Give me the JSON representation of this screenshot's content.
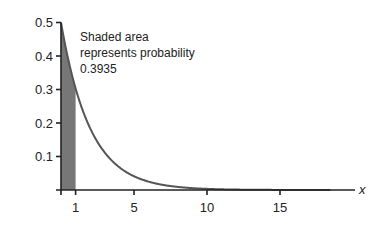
{
  "chart_data": {
    "type": "area",
    "title": "",
    "xlabel": "x",
    "ylabel": "",
    "function": "0.5 * exp(-0.5 * x)",
    "x": [
      0,
      1,
      2,
      3,
      4,
      5,
      6,
      8,
      10,
      12,
      15,
      18.5
    ],
    "values": [
      0.5,
      0.3033,
      0.1839,
      0.1116,
      0.0677,
      0.041,
      0.0249,
      0.0092,
      0.0034,
      0.0012,
      0.0003,
      0.0
    ],
    "shaded_region": {
      "from": 0,
      "to": 1,
      "probability": 0.3935
    },
    "xticks": [
      "1",
      "5",
      "10",
      "15"
    ],
    "yticks": [
      "0.1",
      "0.2",
      "0.3",
      "0.4",
      "0.5"
    ],
    "ylim": [
      0,
      0.5
    ],
    "xlim": [
      0,
      18.5
    ],
    "grid": false,
    "legend": null,
    "annotation": [
      "Shaded area",
      "represents probability",
      "0.3935"
    ],
    "colors": {
      "curve": "#555555",
      "shade": "#777777",
      "axis": "#222222"
    }
  }
}
